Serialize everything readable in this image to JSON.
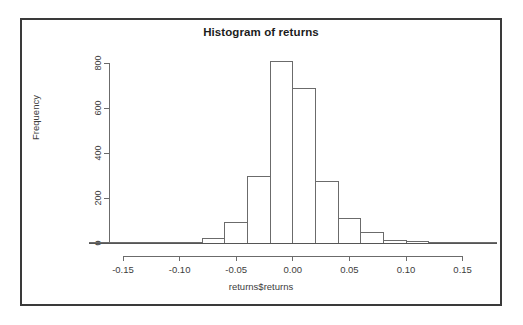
{
  "figure": {
    "title": "Histogram of returns",
    "xlabel": "returns$returns",
    "ylabel": "Frequency"
  },
  "chart_data": {
    "type": "bar",
    "title": "Histogram of returns",
    "xlabel": "returns$returns",
    "ylabel": "Frequency",
    "xlim": [
      -0.18,
      0.18
    ],
    "ylim": [
      0,
      830
    ],
    "grid": false,
    "legend": null,
    "bin_width": 0.02,
    "bin_edges": [
      -0.18,
      -0.16,
      -0.14,
      -0.12,
      -0.1,
      -0.08,
      -0.06,
      -0.04,
      -0.02,
      0.0,
      0.02,
      0.04,
      0.06,
      0.08,
      0.1,
      0.12,
      0.14,
      0.16,
      0.18
    ],
    "categories": [
      "-0.18..-0.16",
      "-0.16..-0.14",
      "-0.14..-0.12",
      "-0.12..-0.10",
      "-0.10..-0.08",
      "-0.08..-0.06",
      "-0.06..-0.04",
      "-0.04..-0.02",
      "-0.02..0.00",
      "0.00..0.02",
      "0.02..0.04",
      "0.04..0.06",
      "0.06..0.08",
      "0.08..0.10",
      "0.10..0.12",
      "0.12..0.14",
      "0.14..0.16",
      "0.16..0.18"
    ],
    "values": [
      1,
      1,
      2,
      2,
      3,
      22,
      90,
      295,
      805,
      685,
      275,
      107,
      45,
      12,
      8,
      2,
      1,
      1
    ],
    "xticks": [
      -0.15,
      -0.1,
      -0.05,
      0.0,
      0.05,
      0.1,
      0.15
    ],
    "xtick_labels": [
      "-0.15",
      "-0.10",
      "-0.05",
      "0.00",
      "0.05",
      "0.10",
      "0.15"
    ],
    "yticks": [
      0,
      200,
      400,
      600,
      800
    ],
    "ytick_labels": [
      "0",
      "200",
      "400",
      "600",
      "800"
    ]
  },
  "style": {
    "frame_color": "#3a3a3a",
    "axis_color": "#6b6b6b",
    "bar_fill": "#ffffff",
    "bar_stroke": "#6b6b6b",
    "text_color": "#3d3d3d",
    "title_color": "#1c1c1c",
    "background": "#ffffff"
  }
}
